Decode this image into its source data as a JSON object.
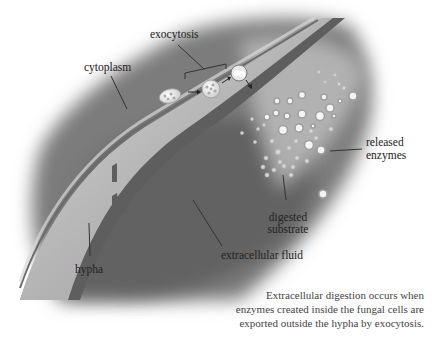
{
  "diagram": {
    "labels": {
      "exocytosis": "exocytosis",
      "cytoplasm": "cytoplasm",
      "released_enzymes_line1": "released",
      "released_enzymes_line2": "enzymes",
      "digested_substrate_line1": "digested",
      "digested_substrate_line2": "substrate",
      "extracellular_fluid": "extracellular fluid",
      "hypha": "hypha"
    },
    "caption": {
      "line1": "Extracellular digestion occurs when",
      "line2": "enzymes created inside the fungal cells are",
      "line3": "exported outside the hypha by exocytosis."
    },
    "colors": {
      "background": "#ffffff",
      "substrate_dark": "#6e6e6e",
      "hypha_wall": "#5a5a5a",
      "cytoplasm": "#a8a8a8",
      "label_text": "#222222",
      "caption_text": "#444444",
      "leader_line": "#333333"
    }
  }
}
